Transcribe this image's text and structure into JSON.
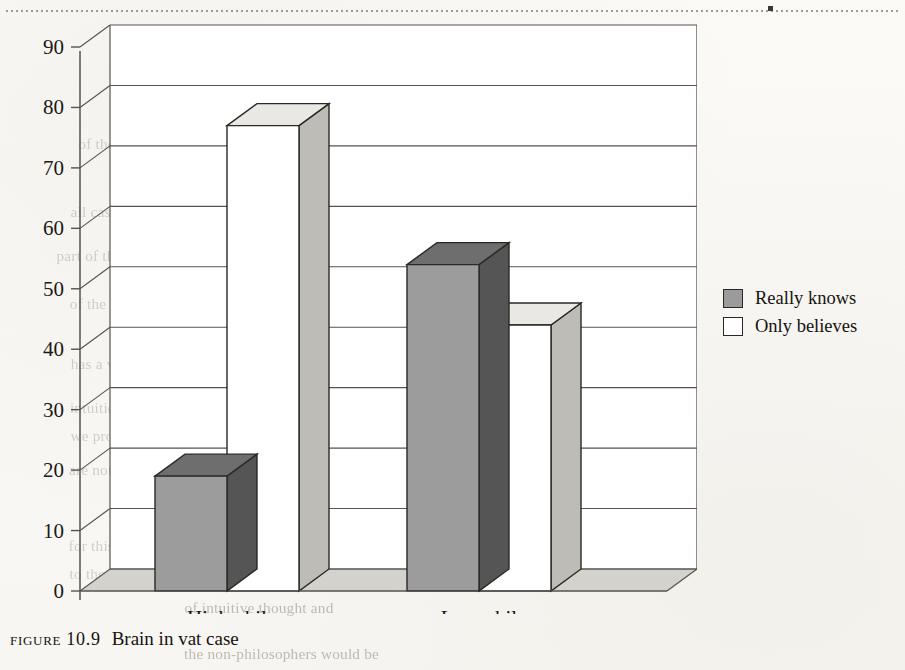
{
  "page": {
    "caption_prefix": "FIGURE 10.9",
    "caption_title": "Brain in vat case"
  },
  "legend": {
    "position": "right",
    "items": [
      {
        "label": "Really knows",
        "color": "#9b9b9b",
        "swatch": "filled-gray-swatch"
      },
      {
        "label": "Only believes",
        "color": "#ffffff",
        "swatch": "empty-white-swatch"
      }
    ]
  },
  "ghost_text": {
    "lines": [
      {
        "text": "and in the second case he does not.",
        "x": 190,
        "y": 46,
        "size": 15
      },
      {
        "text": "to our Gettier-style cases, and there is",
        "x": 236,
        "y": 66,
        "size": 15
      },
      {
        "text": "the epistemic value of this.",
        "x": 300,
        "y": 88,
        "size": 15
      },
      {
        "text": "of these arguments may be",
        "x": 80,
        "y": 136,
        "size": 15
      },
      {
        "text": "to some widely shared intuitions about",
        "x": 210,
        "y": 158,
        "size": 15
      },
      {
        "text": "relevant to the question",
        "x": 262,
        "y": 180,
        "size": 15
      },
      {
        "text": "all cases of knowledge",
        "x": 72,
        "y": 204,
        "size": 15
      },
      {
        "text": "fallible and so a",
        "x": 240,
        "y": 226,
        "size": 15
      },
      {
        "text": "part of this, the idea that what matters for the evaluation",
        "x": 60,
        "y": 248,
        "size": 15
      },
      {
        "text": "with more sceptical worries",
        "x": 300,
        "y": 272,
        "size": 15
      },
      {
        "text": "of the cases, as a philosopher might",
        "x": 72,
        "y": 296,
        "size": 15
      },
      {
        "text": "than in the non-accidental",
        "x": 240,
        "y": 320,
        "size": 15
      },
      {
        "text": "has a view about what",
        "x": 72,
        "y": 356,
        "size": 15
      },
      {
        "text": "the epistemic value",
        "x": 244,
        "y": 378,
        "size": 15
      },
      {
        "text": "intuitions simply are to be trusted.",
        "x": 72,
        "y": 400,
        "size": 15
      },
      {
        "text": "we provide to explain the",
        "x": 72,
        "y": 428,
        "size": 15
      },
      {
        "text": "are not philosophers and to students the difference",
        "x": 72,
        "y": 462,
        "size": 15
      },
      {
        "text": "is not apparent. And there is no case",
        "x": 250,
        "y": 486,
        "size": 15
      },
      {
        "text": "be a philosopher is itself to be different in",
        "x": 190,
        "y": 510,
        "size": 15
      },
      {
        "text": "for this. Maybe philosophers are also different in other",
        "x": 72,
        "y": 538,
        "size": 15
      },
      {
        "text": "to the predictions of a particular theory",
        "x": 72,
        "y": 566,
        "size": 15
      },
      {
        "text": "of intuitive thought and",
        "x": 186,
        "y": 600,
        "size": 15
      },
      {
        "text": "the non-philosophers would be",
        "x": 186,
        "y": 646,
        "size": 15
      }
    ]
  },
  "chart_data": {
    "type": "bar",
    "title": "Brain in vat case",
    "style": "3d-column",
    "xlabel": "",
    "ylabel": "",
    "ylim": [
      0,
      90
    ],
    "ytick_step": 10,
    "yticks": [
      "0",
      "10",
      "20",
      "30",
      "40",
      "50",
      "60",
      "70",
      "80",
      "90"
    ],
    "grid": true,
    "categories": [
      "High phil",
      "Low phil"
    ],
    "series": [
      {
        "name": "Really knows",
        "color": "#9b9b9b",
        "values": [
          19,
          54
        ]
      },
      {
        "name": "Only believes",
        "color": "#ffffff",
        "values": [
          77,
          44
        ]
      }
    ]
  }
}
